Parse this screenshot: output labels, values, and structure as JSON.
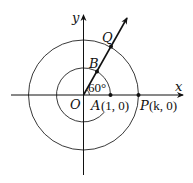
{
  "diagram": {
    "axes": {
      "x_label": "x",
      "y_label": "y",
      "origin_label": "O"
    },
    "angle_label": "60°",
    "points": {
      "A": {
        "name": "A",
        "coords": "(1, 0)"
      },
      "P": {
        "name": "P",
        "coords": "(k, 0)"
      },
      "B": {
        "name": "B"
      },
      "Q": {
        "name": "Q"
      }
    },
    "circles": [
      {
        "name": "unit-circle",
        "radius_units": 1
      },
      {
        "name": "outer-circle",
        "radius_units": "k"
      }
    ],
    "ray": {
      "angle_deg": 60,
      "passes_through": [
        "B",
        "Q"
      ]
    },
    "colors": {
      "stroke": "#111111",
      "background": "#ffffff"
    }
  }
}
